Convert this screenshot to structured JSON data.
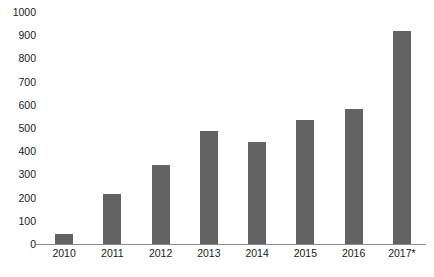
{
  "chart_data": {
    "type": "bar",
    "title": "",
    "subtitle": "",
    "xlabel": "",
    "ylabel": "",
    "categories": [
      "2010",
      "2011",
      "2012",
      "2013",
      "2014",
      "2015",
      "2016",
      "2017*"
    ],
    "values": [
      45,
      215,
      340,
      485,
      440,
      535,
      580,
      920
    ],
    "series": [
      {
        "name": "",
        "values": [
          45,
          215,
          340,
          485,
          440,
          535,
          580,
          920
        ]
      }
    ],
    "ylim": [
      0,
      1000
    ],
    "y_ticks": [
      0,
      100,
      200,
      300,
      400,
      500,
      600,
      700,
      800,
      900,
      1000
    ],
    "y_tick_labels": [
      "0",
      "100",
      "200",
      "300",
      "400",
      "500",
      "600",
      "700",
      "800",
      "900",
      "1000"
    ],
    "grid": false,
    "legend": false,
    "legend_position": "none",
    "annotations": [
      "2017 value is marked with an asterisk"
    ]
  },
  "style": {
    "bar_color": "#636363",
    "axis_color": "#8c8c8c",
    "text_color": "#1a1a1a",
    "background": "#ffffff"
  },
  "caption": {
    "text": ""
  }
}
